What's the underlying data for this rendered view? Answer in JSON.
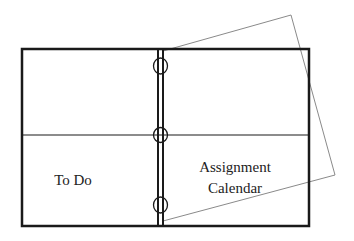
{
  "diagram": {
    "left_panel": {
      "bottom_label": "To Do"
    },
    "right_panel": {
      "bottom_label_line1": "Assignment",
      "bottom_label_line2": "Calendar"
    },
    "rings": 3,
    "colors": {
      "outline": "#1a1a1a",
      "sheet": "#8a8a8a",
      "text": "#222222",
      "background": "#ffffff"
    }
  }
}
